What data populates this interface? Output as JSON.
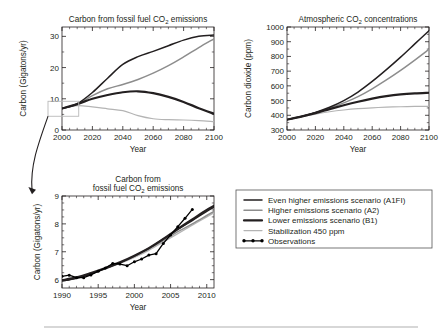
{
  "figure": {
    "name": "co2-emissions-and-concentrations-figure",
    "bottom_rule": true
  },
  "series_styles": {
    "a1fi": {
      "color": "#231f20",
      "width": 1.5
    },
    "a2": {
      "color": "#8d8d8d",
      "width": 1.5
    },
    "b1": {
      "color": "#231f20",
      "width": 2.2
    },
    "stab": {
      "color": "#b4b4b4",
      "width": 1.2
    },
    "obs": {
      "color": "#000000",
      "width": 1.3
    }
  },
  "legend": {
    "name": "scenario-legend",
    "items": [
      {
        "key": "a1fi",
        "label": "Even higher emissions scenario (A1FI)",
        "swatch": "line"
      },
      {
        "key": "a2",
        "label": "Higher emissions scenario (A2)",
        "swatch": "line"
      },
      {
        "key": "b1",
        "label": "Lower emissions scenario (B1)",
        "swatch": "line"
      },
      {
        "key": "stab",
        "label": "Stabilization 450 ppm",
        "swatch": "line"
      },
      {
        "key": "obs",
        "label": "Observations",
        "swatch": "line-markers"
      }
    ]
  },
  "chart_data": [
    {
      "id": "emissions-projection",
      "type": "line",
      "title": "Carbon from fossil fuel CO2 emissions",
      "title_parts": [
        "Carbon from fossil fuel CO",
        "2",
        " emissions"
      ],
      "xlabel": "Year",
      "ylabel": "Carbon (Gigatons/yr)",
      "xlim": [
        2000,
        2100
      ],
      "ylim": [
        0,
        33
      ],
      "xticks": [
        2000,
        2020,
        2040,
        2060,
        2080,
        2100
      ],
      "yticks": [
        0,
        10,
        20,
        30
      ],
      "grid": false,
      "highlight_box": {
        "x0": 2000,
        "x1": 2011,
        "y0": 4.4,
        "y1": 9.2
      },
      "x": [
        2000,
        2010,
        2020,
        2030,
        2040,
        2050,
        2060,
        2070,
        2080,
        2090,
        2100
      ],
      "series": [
        {
          "name": "Even higher emissions scenario (A1FI)",
          "key": "a1fi",
          "values": [
            6.9,
            8.4,
            12.0,
            16.6,
            21.0,
            23.5,
            25.2,
            27.0,
            28.8,
            30.0,
            30.4
          ]
        },
        {
          "name": "Higher emissions scenario (A2)",
          "key": "a2",
          "values": [
            6.9,
            8.2,
            11.0,
            13.2,
            14.6,
            16.2,
            18.2,
            20.6,
            23.4,
            26.4,
            29.2
          ]
        },
        {
          "name": "Lower emissions scenario (B1)",
          "key": "b1",
          "values": [
            6.9,
            8.3,
            10.0,
            11.2,
            12.1,
            12.4,
            11.8,
            10.6,
            9.0,
            7.0,
            5.2
          ]
        },
        {
          "name": "Stabilization 450 ppm",
          "key": "stab",
          "values": [
            6.9,
            7.8,
            7.4,
            6.8,
            6.2,
            4.6,
            3.6,
            3.3,
            3.2,
            3.0,
            2.7
          ]
        }
      ]
    },
    {
      "id": "atmospheric-concentration",
      "type": "line",
      "title": "Atmospheric CO2 concentrations",
      "title_parts": [
        "Atmospheric CO",
        "2",
        " concentrations"
      ],
      "xlabel": "Year",
      "ylabel": "Carbon dioxide (ppm)",
      "xlim": [
        2000,
        2100
      ],
      "ylim": [
        300,
        1000
      ],
      "xticks": [
        2000,
        2020,
        2040,
        2060,
        2080,
        2100
      ],
      "yticks": [
        300,
        400,
        500,
        600,
        700,
        800,
        900,
        1000
      ],
      "grid": false,
      "x": [
        2000,
        2010,
        2020,
        2030,
        2040,
        2050,
        2060,
        2070,
        2080,
        2090,
        2100
      ],
      "series": [
        {
          "name": "Even higher emissions scenario (A1FI)",
          "key": "a1fi",
          "values": [
            370,
            392,
            420,
            455,
            500,
            558,
            630,
            710,
            795,
            885,
            975
          ]
        },
        {
          "name": "Higher emissions scenario (A2)",
          "key": "a2",
          "values": [
            370,
            391,
            417,
            448,
            484,
            527,
            580,
            640,
            705,
            775,
            848
          ]
        },
        {
          "name": "Lower emissions scenario (B1)",
          "key": "b1",
          "values": [
            370,
            391,
            415,
            442,
            468,
            492,
            513,
            530,
            542,
            549,
            553
          ]
        },
        {
          "name": "Stabilization 450 ppm",
          "key": "stab",
          "values": [
            370,
            389,
            408,
            424,
            436,
            445,
            451,
            455,
            458,
            460,
            461
          ]
        }
      ]
    },
    {
      "id": "emissions-recent-inset",
      "type": "line",
      "title": "Carbon from fossil fuel CO2 emissions",
      "title_parts": [
        "Carbon from",
        "fossil fuel CO",
        "2",
        " emissions"
      ],
      "xlabel": "Year",
      "ylabel": "Carbon (Gigatons/yr)",
      "xlim": [
        1990,
        2011
      ],
      "ylim": [
        5.7,
        9.0
      ],
      "xticks": [
        1990,
        1995,
        2000,
        2005,
        2010
      ],
      "yticks": [
        6,
        7,
        8,
        9
      ],
      "grid": false,
      "x": [
        1990,
        1992,
        1994,
        1996,
        1998,
        2000,
        2002,
        2004,
        2006,
        2008,
        2010,
        2011
      ],
      "series": [
        {
          "name": "Even higher emissions scenario (A1FI)",
          "key": "a1fi",
          "values": [
            5.95,
            6.05,
            6.2,
            6.4,
            6.6,
            6.85,
            7.12,
            7.45,
            7.8,
            8.12,
            8.45,
            8.6
          ]
        },
        {
          "name": "Higher emissions scenario (A2)",
          "key": "a2",
          "values": [
            5.95,
            6.06,
            6.22,
            6.4,
            6.6,
            6.84,
            7.1,
            7.4,
            7.72,
            8.0,
            8.3,
            8.45
          ]
        },
        {
          "name": "Lower emissions scenario (B1)",
          "key": "b1",
          "values": [
            5.98,
            6.08,
            6.24,
            6.42,
            6.62,
            6.86,
            7.13,
            7.46,
            7.82,
            8.16,
            8.5,
            8.65
          ]
        },
        {
          "name": "Stabilization 450 ppm",
          "key": "stab",
          "values": [
            5.95,
            6.05,
            6.2,
            6.38,
            6.58,
            6.8,
            7.05,
            7.35,
            7.65,
            7.95,
            8.25,
            8.4
          ]
        }
      ],
      "observations": {
        "name": "Observations",
        "key": "obs",
        "x": [
          1990,
          1991,
          1992,
          1993,
          1994,
          1995,
          1996,
          1997,
          1998,
          1999,
          2000,
          2001,
          2002,
          2003,
          2004,
          2005,
          2006,
          2007,
          2008
        ],
        "values": [
          6.12,
          6.16,
          6.07,
          6.07,
          6.17,
          6.3,
          6.42,
          6.58,
          6.56,
          6.5,
          6.64,
          6.74,
          6.88,
          6.93,
          7.3,
          7.6,
          7.9,
          8.2,
          8.52
        ]
      }
    }
  ]
}
